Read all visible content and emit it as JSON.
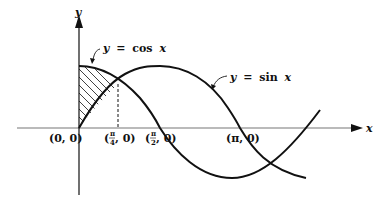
{
  "figure": {
    "axes": {
      "x_label": "x",
      "y_label": "y"
    },
    "curves": [
      {
        "name": "cosine",
        "label_y": "y",
        "label_eq": "=",
        "label_fn": "cos",
        "label_var": "x"
      },
      {
        "name": "sine",
        "label_y": "y",
        "label_eq": "=",
        "label_fn": "sin",
        "label_var": "x"
      }
    ],
    "points": [
      {
        "id": "origin",
        "text": "(0, 0)"
      },
      {
        "id": "pi-over-4",
        "open": "(",
        "num": "π",
        "den": "4",
        "rest": ", 0)"
      },
      {
        "id": "pi-over-2",
        "open": "(",
        "num": "π",
        "den": "2",
        "rest": ", 0)"
      },
      {
        "id": "pi",
        "text": "(π, 0)"
      }
    ],
    "shaded_region": "area between y = cos x and y = sin x from x = 0 to x = π/4",
    "colors": {
      "ink": "#111111",
      "axis": "#777777",
      "background": "#ffffff"
    }
  }
}
